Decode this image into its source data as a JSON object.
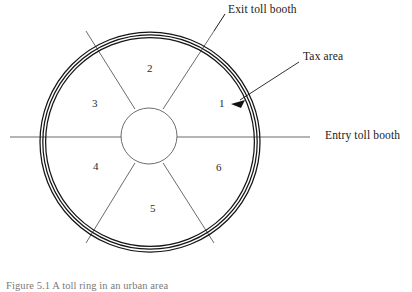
{
  "figure": {
    "caption": "Figure 5.1   A toll ring in an urban area",
    "caption_visible_fragment": "Figure 5.1  A toll ring in an urban area"
  },
  "callouts": [
    {
      "id": "exit-toll-booth",
      "label": "Exit toll booth",
      "pointer": "radial-line-upper-right"
    },
    {
      "id": "tax-area",
      "label": "Tax area",
      "pointer": "arrow-down-left-to-ring"
    },
    {
      "id": "entry-toll-booth",
      "label": "Entry toll booth",
      "pointer": "horizontal-line-right"
    }
  ],
  "diagram": {
    "type": "toll-ring-sector-diagram",
    "outer_ring": {
      "center_x": 150,
      "center_y": 142,
      "outer_radius": 110,
      "ring_band_count": 3,
      "stroke_color": "#1a1a1a"
    },
    "inner_circle": {
      "center_x": 149,
      "center_y": 136,
      "radius": 28,
      "stroke_color": "#555555"
    },
    "sector_count": 6,
    "sectors": [
      {
        "number": "1",
        "position": "right-upper"
      },
      {
        "number": "2",
        "position": "top"
      },
      {
        "number": "3",
        "position": "left-upper"
      },
      {
        "number": "4",
        "position": "left-lower"
      },
      {
        "number": "5",
        "position": "bottom"
      },
      {
        "number": "6",
        "position": "right-lower"
      }
    ],
    "roads": [
      {
        "id": "horizontal-road",
        "orientation": "horizontal",
        "y": 137,
        "x_start": 10,
        "x_end": 310
      },
      {
        "id": "exit-radial-road",
        "orientation": "diagonal-upper-right"
      },
      {
        "id": "divider-upper-left",
        "orientation": "diagonal-upper-left"
      },
      {
        "id": "divider-lower-left",
        "orientation": "diagonal-lower-left"
      },
      {
        "id": "divider-lower-right",
        "orientation": "diagonal-lower-right"
      }
    ]
  },
  "colors": {
    "background": "#ffffff",
    "ink": "#1a1a1a",
    "road": "#555555",
    "caption": "#7a7a7a"
  }
}
